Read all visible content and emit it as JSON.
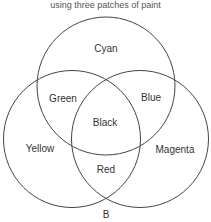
{
  "caption": "using three patches of paint",
  "figure_label": "B",
  "circles": [
    {
      "name": "Cyan",
      "cx": 106,
      "cy": 86,
      "r": 69
    },
    {
      "name": "Yellow",
      "cx": 72,
      "cy": 139,
      "r": 68.5
    },
    {
      "name": "Magenta",
      "cx": 140,
      "cy": 139,
      "r": 68.5
    }
  ],
  "regions": {
    "cyan": "Cyan",
    "yellow": "Yellow",
    "magenta": "Magenta",
    "green": "Green",
    "blue": "Blue",
    "red": "Red",
    "black": "Black"
  },
  "colors": {
    "stroke": "#444444",
    "text": "#333333",
    "background": "#ffffff"
  }
}
